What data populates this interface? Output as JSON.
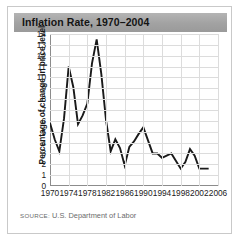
{
  "card": {
    "title": "Inflation Rate, 1970–2004",
    "source_label": "SOURCE:",
    "source_text": "U.S. Department of Labor"
  },
  "colors": {
    "title_bar": "#a2a2a2",
    "title_text": "#141414",
    "line": "#1a1a1a",
    "grid": "#dcdcdc",
    "axis": "#8c8c8c",
    "card_border": "#c9c9c9",
    "background": "#ffffff",
    "source_text": "#6b6b6b"
  },
  "chart_data": {
    "type": "line",
    "title": "Inflation Rate, 1970–2004",
    "xlabel": "",
    "ylabel": "Percentage of change in price level",
    "xlim": [
      1970,
      2006
    ],
    "ylim": [
      0,
      14
    ],
    "grid": true,
    "legend": "none",
    "x_ticks": [
      1970,
      1974,
      1978,
      1982,
      1986,
      1990,
      1994,
      1998,
      2002,
      2006
    ],
    "y_ticks": [
      0,
      1,
      2,
      3,
      4,
      5,
      6,
      7,
      8,
      9,
      10,
      11,
      12,
      13,
      14
    ],
    "x": [
      1970,
      1971,
      1972,
      1973,
      1974,
      1975,
      1976,
      1977,
      1978,
      1979,
      1980,
      1981,
      1982,
      1983,
      1984,
      1985,
      1986,
      1987,
      1988,
      1989,
      1990,
      1991,
      1992,
      1993,
      1994,
      1995,
      1996,
      1997,
      1998,
      1999,
      2000,
      2001,
      2002,
      2003,
      2004
    ],
    "values": [
      5.8,
      4.3,
      3.2,
      6.2,
      11.0,
      9.1,
      5.7,
      6.5,
      7.6,
      11.3,
      13.5,
      10.3,
      6.1,
      3.2,
      4.3,
      3.5,
      1.9,
      3.6,
      4.1,
      4.8,
      5.4,
      4.2,
      3.0,
      3.0,
      2.6,
      2.8,
      3.0,
      2.3,
      1.6,
      2.2,
      3.4,
      2.8,
      1.6,
      1.6,
      1.6
    ],
    "series": [
      {
        "name": "Inflation rate",
        "values": [
          5.8,
          4.3,
          3.2,
          6.2,
          11.0,
          9.1,
          5.7,
          6.5,
          7.6,
          11.3,
          13.5,
          10.3,
          6.1,
          3.2,
          4.3,
          3.5,
          1.9,
          3.6,
          4.1,
          4.8,
          5.4,
          4.2,
          3.0,
          3.0,
          2.6,
          2.8,
          3.0,
          2.3,
          1.6,
          2.2,
          3.4,
          2.8,
          1.6,
          1.6,
          1.6
        ]
      }
    ]
  }
}
